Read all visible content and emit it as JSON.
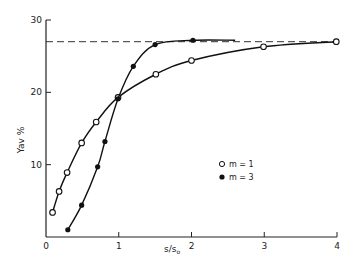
{
  "chart_data": {
    "type": "line",
    "title": "",
    "xlabel": "s/s₀",
    "ylabel": "Yav %",
    "xlim": [
      0,
      4
    ],
    "ylim": [
      0,
      30
    ],
    "xticks": [
      0,
      1,
      2,
      3,
      4
    ],
    "yticks": [
      10,
      20,
      30
    ],
    "xtick_labels": [
      "0",
      "1",
      "2",
      "3",
      "4"
    ],
    "ytick_labels": [
      "10",
      "20",
      "30"
    ],
    "grid": false,
    "legend_position": "lower right (inside)",
    "reference_line": {
      "style": "dashed",
      "y": 27,
      "x_range": [
        0,
        4
      ]
    },
    "series": [
      {
        "name": "m = 1",
        "marker": "open-circle",
        "x": [
          0.09,
          0.18,
          0.29,
          0.49,
          0.69,
          0.99,
          1.51,
          2.0,
          2.99,
          3.99
        ],
        "y": [
          3.4,
          6.3,
          8.9,
          13.0,
          15.9,
          19.3,
          22.5,
          24.4,
          26.3,
          27.0
        ]
      },
      {
        "name": "m = 3",
        "marker": "filled-circle",
        "x": [
          0.3,
          0.49,
          0.71,
          0.81,
          0.99,
          1.2,
          1.5,
          2.02
        ],
        "y": [
          1.0,
          4.4,
          9.7,
          13.2,
          19.1,
          23.6,
          26.6,
          27.2
        ],
        "curve_extends_to_x": 2.6
      }
    ]
  },
  "labels": {
    "xlabel_main": "s/s",
    "xlabel_sub": "o",
    "ylabel": "Yav %",
    "legend_m1": "m = 1",
    "legend_m3": "m = 3"
  }
}
